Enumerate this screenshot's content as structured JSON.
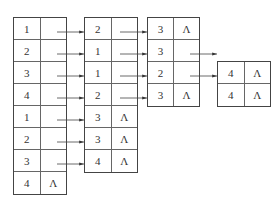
{
  "diagram": {
    "null_symbol": "Λ",
    "tables": [
      {
        "id": "t1",
        "rows": [
          {
            "value": "1",
            "ptr": ""
          },
          {
            "value": "2",
            "ptr": ""
          },
          {
            "value": "3",
            "ptr": ""
          },
          {
            "value": "4",
            "ptr": ""
          },
          {
            "value": "1",
            "ptr": ""
          },
          {
            "value": "2",
            "ptr": ""
          },
          {
            "value": "3",
            "ptr": ""
          },
          {
            "value": "4",
            "ptr": "Λ"
          }
        ]
      },
      {
        "id": "t2",
        "rows": [
          {
            "value": "2",
            "ptr": ""
          },
          {
            "value": "1",
            "ptr": ""
          },
          {
            "value": "1",
            "ptr": ""
          },
          {
            "value": "2",
            "ptr": ""
          },
          {
            "value": "3",
            "ptr": "Λ"
          },
          {
            "value": "3",
            "ptr": "Λ"
          },
          {
            "value": "4",
            "ptr": "Λ"
          }
        ]
      },
      {
        "id": "t3",
        "rows": [
          {
            "value": "3",
            "ptr": "Λ"
          },
          {
            "value": "3",
            "ptr": ""
          },
          {
            "value": "2",
            "ptr": ""
          },
          {
            "value": "3",
            "ptr": "Λ"
          }
        ]
      },
      {
        "id": "t4",
        "rows": [
          {
            "value": "4",
            "ptr": "Λ"
          },
          {
            "value": "4",
            "ptr": "Λ"
          }
        ]
      }
    ]
  }
}
